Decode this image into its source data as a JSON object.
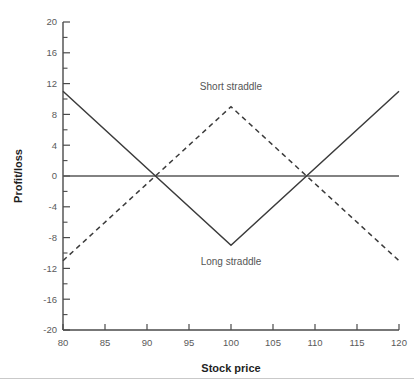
{
  "chart_data": {
    "type": "line",
    "title": "",
    "xlabel": "Stock price",
    "ylabel": "Profit/loss",
    "xlim": [
      80,
      120
    ],
    "ylim": [
      -20,
      20
    ],
    "grid": false,
    "legend_position": "inline-annotations",
    "x_ticks": [
      80,
      85,
      90,
      95,
      100,
      105,
      110,
      115,
      120
    ],
    "x_tick_labels": [
      "80",
      "85",
      "90",
      "95",
      "100",
      "105",
      "110",
      "115",
      "120"
    ],
    "y_ticks": [
      -20,
      -16,
      -12,
      -8,
      -4,
      0,
      4,
      8,
      12,
      16,
      20
    ],
    "y_tick_labels": [
      "-20",
      "-16",
      "-12",
      "-8",
      "-4",
      "0",
      "4",
      "8",
      "12",
      "16",
      "20"
    ],
    "y_minor_ticks": [
      -18,
      -14,
      -10,
      -6,
      -2,
      2,
      6,
      10,
      14,
      18
    ],
    "zero_reference_line": 0,
    "series": [
      {
        "name": "Long straddle",
        "style": "solid",
        "color": "#3b3b3b",
        "x": [
          80,
          100,
          120
        ],
        "values": [
          11,
          -9,
          11
        ]
      },
      {
        "name": "Short straddle",
        "style": "dashed",
        "color": "#3b3b3b",
        "x": [
          80,
          100,
          120
        ],
        "values": [
          -11,
          9,
          -11
        ]
      }
    ],
    "annotations": [
      {
        "text": "Short straddle",
        "x": 100,
        "y": 11.2
      },
      {
        "text": "Long straddle",
        "x": 100,
        "y": -11.6
      }
    ]
  },
  "axes": {
    "x_title": "Stock price",
    "y_title": "Profit/loss"
  },
  "colors": {
    "background": "#ffffff",
    "axis": "#4a4a4a",
    "series": "#3b3b3b",
    "tick_text": "#5a5a5a",
    "title_text": "#1f1f1f",
    "rule": "#c9c9c9"
  }
}
